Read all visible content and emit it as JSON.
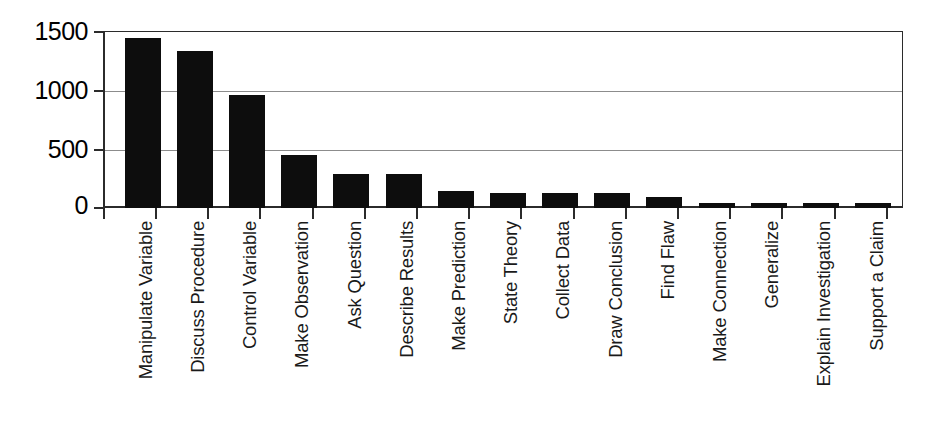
{
  "chart_data": {
    "type": "bar",
    "title": "",
    "subtitle": "",
    "xlabel": "",
    "ylabel": "",
    "ylim": [
      0,
      1500
    ],
    "yticks": [
      0,
      500,
      1000,
      1500
    ],
    "ytick_labels": [
      "0",
      "500",
      "1000",
      "1500"
    ],
    "grid": true,
    "grid_axis": "y",
    "legend": false,
    "legend_position": "none",
    "orientation": "vertical",
    "bar_color": "#0d0d0d",
    "categories": [
      "Manipulate Variable",
      "Discuss Procedure",
      "Control Variable",
      "Make Observation",
      "Ask Question",
      "Describe Results",
      "Make Prediction",
      "State Theory",
      "Collect Data",
      "Draw Conclusion",
      "Find Flaw",
      "Make Connection",
      "Generalize",
      "Explain Investigation",
      "Support a Claim"
    ],
    "values": [
      1440,
      1330,
      955,
      445,
      285,
      285,
      148,
      128,
      128,
      128,
      95,
      42,
      45,
      45,
      45
    ]
  },
  "axes": {
    "y_tick_labels": [
      "1500",
      "1000",
      "500",
      "0"
    ],
    "y_max": 1500,
    "y_min": 0
  }
}
